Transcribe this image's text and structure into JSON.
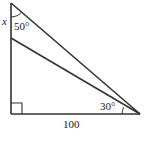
{
  "diagram": {
    "type": "geometry-triangle",
    "labels": {
      "x_label": "x",
      "top_angle": "50°",
      "right_angle_label": "30°",
      "base_length": "100"
    },
    "points": {
      "top_apex": [
        11,
        3
      ],
      "inner_apex": [
        11,
        38
      ],
      "bottom_left": [
        11,
        114
      ],
      "right_vertex": [
        140,
        114
      ]
    },
    "colors": {
      "stroke": "#333333",
      "background": "#ffffff"
    }
  }
}
